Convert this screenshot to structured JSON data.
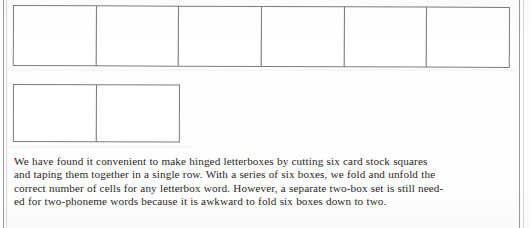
{
  "figure": {
    "caption_lines": [
      "We have found it convenient to make hinged letterboxes by cutting six card stock squares",
      "and taping them together in a single row. With a series of six boxes, we fold and unfold the",
      "correct number of cells for any letterbox word. However, a separate two-box set is still need-",
      "ed for two-phoneme words because it is awkward to fold six boxes down to two."
    ],
    "caption_text": "We have found it convenient to make hinged letterboxes by cutting six card stock squares and taping them together in a single row. With a series of six boxes, we fold and unfold the correct number of cells for any letterbox word. However, a separate two-box set is still needed for two-phoneme words because it is awkward to fold six boxes down to two.",
    "strips": [
      {
        "name": "six-box-letterbox-strip",
        "cell_count": 6,
        "cells": [
          "",
          "",
          "",
          "",
          "",
          ""
        ]
      },
      {
        "name": "two-box-letterbox-strip",
        "cell_count": 2,
        "cells": [
          "",
          ""
        ]
      }
    ],
    "colors": {
      "page_background": "#fefefe",
      "cell_border": "#7b7b7b",
      "page_rule": "#9a9a9a",
      "text": "#2a2724"
    }
  }
}
